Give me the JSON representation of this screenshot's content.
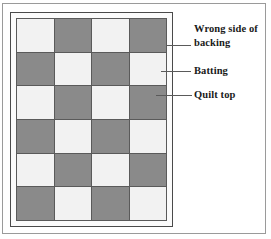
{
  "figure": {
    "type": "quilt-layer-diagram"
  },
  "colors": {
    "light_square": "#f2f2f2",
    "dark_square": "#8a8a8a",
    "gridline": "#5a5a5a",
    "frame_border": "#4a4a4a",
    "page_border": "#9a9a9a",
    "mat": "#fbfbfb",
    "text": "#1a1a1a",
    "leader_line": "#5a5a5a"
  },
  "quilt": {
    "columns": 4,
    "rows": 6,
    "grid": [
      [
        "light",
        "dark",
        "light",
        "dark"
      ],
      [
        "dark",
        "light",
        "dark",
        "light"
      ],
      [
        "light",
        "dark",
        "light",
        "dark"
      ],
      [
        "dark",
        "light",
        "dark",
        "light"
      ],
      [
        "light",
        "dark",
        "light",
        "dark"
      ],
      [
        "dark",
        "light",
        "dark",
        "light"
      ]
    ]
  },
  "callouts": [
    {
      "id": "backing",
      "label": "Wrong side of\nbacking"
    },
    {
      "id": "batting",
      "label": "Batting"
    },
    {
      "id": "quilttop",
      "label": "Quilt top"
    }
  ]
}
